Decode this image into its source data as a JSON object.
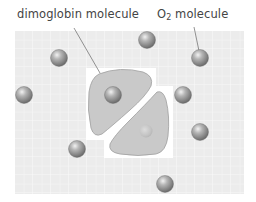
{
  "labels": {
    "dimoglobin": "dimoglobin molecule",
    "o2_prefix": "O",
    "o2_sub": "2",
    "o2_suffix": " molecule"
  },
  "colors": {
    "grid_bg": "#ececec",
    "grid_line": "#f8f8f8",
    "protein_fill": "#c9c9c9",
    "protein_stroke": "#9a9a9a",
    "sphere_light": "#e4e4e4",
    "sphere_dark": "#6f6f6f",
    "leader_line": "#666666",
    "text": "#444444"
  },
  "molecules": {
    "o2_spheres": [
      {
        "cx": 59,
        "cy": 58
      },
      {
        "cx": 147,
        "cy": 40
      },
      {
        "cx": 200,
        "cy": 58
      },
      {
        "cx": 24,
        "cy": 95
      },
      {
        "cx": 113,
        "cy": 95
      },
      {
        "cx": 183,
        "cy": 95
      },
      {
        "cx": 200,
        "cy": 132
      },
      {
        "cx": 77,
        "cy": 149
      },
      {
        "cx": 165,
        "cy": 184
      }
    ],
    "empty_binding_site": {
      "cx": 146,
      "cy": 131
    }
  }
}
